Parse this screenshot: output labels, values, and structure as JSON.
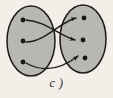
{
  "figure": {
    "caption": "c )",
    "type": "function-mapping-diagram",
    "background_color": "#f2efe9",
    "set_fill_color": "#b9b7b4",
    "set_stroke_color": "#1d1b1a",
    "node_color": "#181716",
    "edge_color": "#1d1b1a",
    "domain_set": {
      "name": "domain-oval",
      "label": "",
      "cx": 31,
      "cy": 41,
      "rx": 24,
      "ry": 35,
      "nodes": [
        {
          "id": "a1",
          "label": "",
          "cx": 23,
          "cy": 20
        },
        {
          "id": "a2",
          "label": "",
          "cx": 23,
          "cy": 41
        },
        {
          "id": "a3",
          "label": "",
          "cx": 23,
          "cy": 62
        }
      ]
    },
    "codomain_set": {
      "name": "codomain-oval",
      "label": "",
      "cx": 83,
      "cy": 39,
      "rx": 23,
      "ry": 34,
      "nodes": [
        {
          "id": "b1",
          "label": "",
          "cx": 84,
          "cy": 18
        },
        {
          "id": "b2",
          "label": "",
          "cx": 83,
          "cy": 40
        },
        {
          "id": "b3",
          "label": "",
          "cx": 85,
          "cy": 58
        }
      ]
    },
    "edges": [
      {
        "id": "e1",
        "from": "a1",
        "to": "b2",
        "path": "M 26 20 C 45 21 60 36 75 40"
      },
      {
        "id": "e2",
        "from": "a2",
        "to": "b1",
        "path": "M 26 42 C 45 42 60 22 76 18"
      },
      {
        "id": "e3",
        "from": "a3",
        "to": "b3",
        "path": "M 26 63 C 42 72 60 70 78 56"
      }
    ],
    "node_radius": 2.4,
    "arrowhead": "triangle"
  }
}
